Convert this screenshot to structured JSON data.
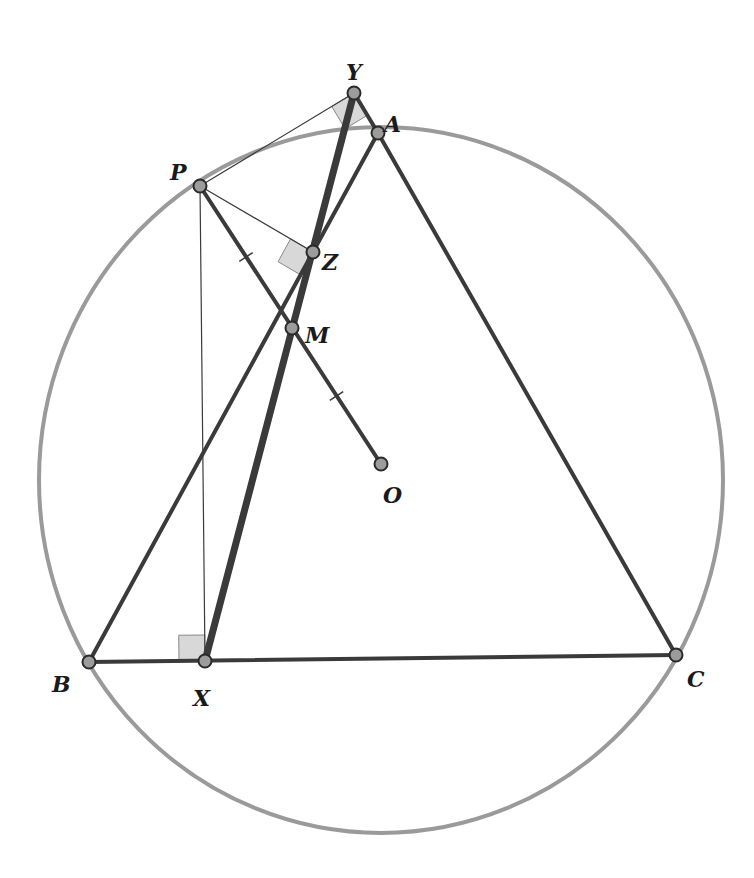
{
  "diagram": {
    "type": "geometry-construction",
    "colors": {
      "circle": "#9a9a9a",
      "segment": "#3a3a3a",
      "simson_line": "#3a3a3a",
      "thin_line": "#3a3a3a",
      "point_fill": "#9c9c9c",
      "point_stroke": "#2a2a2a",
      "right_angle_fill": "#d8d8d8",
      "right_angle_stroke": "#888888",
      "label": "#1a1a1a"
    },
    "circle": {
      "center": "O",
      "cx": 381,
      "cy": 480,
      "rx": 342,
      "ry": 353
    },
    "points": [
      {
        "id": "Y",
        "label": "Y",
        "x": 354,
        "y": 93,
        "lx": 346,
        "ly": 72
      },
      {
        "id": "A",
        "label": "A",
        "x": 378,
        "y": 133,
        "lx": 384,
        "ly": 124
      },
      {
        "id": "P",
        "label": "P",
        "x": 200,
        "y": 186,
        "lx": 170,
        "ly": 172
      },
      {
        "id": "Z",
        "label": "Z",
        "x": 313,
        "y": 252,
        "lx": 322,
        "ly": 262
      },
      {
        "id": "M",
        "label": "M",
        "x": 292,
        "y": 328,
        "lx": 305,
        "ly": 335
      },
      {
        "id": "O",
        "label": "O",
        "x": 381,
        "y": 464,
        "lx": 383,
        "ly": 495
      },
      {
        "id": "B",
        "label": "B",
        "x": 89,
        "y": 662,
        "lx": 52,
        "ly": 684
      },
      {
        "id": "X",
        "label": "X",
        "x": 205,
        "y": 661,
        "lx": 193,
        "ly": 698
      },
      {
        "id": "C",
        "label": "C",
        "x": 676,
        "y": 655,
        "lx": 687,
        "ly": 679
      }
    ],
    "segments": [
      {
        "from": "A",
        "to": "B",
        "style": "medium",
        "name": "side-ab"
      },
      {
        "from": "A",
        "to": "C",
        "style": "medium",
        "name": "side-ac"
      },
      {
        "from": "B",
        "to": "C",
        "style": "medium",
        "name": "side-bc"
      },
      {
        "from": "Y",
        "to": "A",
        "style": "medium",
        "name": "extension-ca-to-y"
      },
      {
        "from": "P",
        "to": "O",
        "style": "medium",
        "name": "segment-po"
      },
      {
        "from": "X",
        "to": "Y",
        "style": "thick",
        "name": "simson-line-xy"
      },
      {
        "from": "P",
        "to": "Y",
        "style": "thin",
        "name": "perpendicular-py"
      },
      {
        "from": "P",
        "to": "Z",
        "style": "thin",
        "name": "perpendicular-pz"
      },
      {
        "from": "P",
        "to": "X",
        "style": "thin",
        "name": "perpendicular-px"
      }
    ],
    "tick_marks": [
      {
        "on": "PM",
        "name": "tick-pm"
      },
      {
        "on": "MO",
        "name": "tick-mo"
      }
    ],
    "right_angles": [
      {
        "at": "Y",
        "name": "right-angle-y"
      },
      {
        "at": "Z",
        "name": "right-angle-z"
      },
      {
        "at": "X",
        "name": "right-angle-x"
      }
    ]
  }
}
